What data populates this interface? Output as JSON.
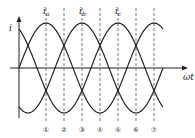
{
  "diagram": {
    "y_axis_label": "i",
    "x_axis_label": "ωt",
    "curves": [
      {
        "name": "ia",
        "label_main": "i",
        "label_sub": "a",
        "peak_x": 46
      },
      {
        "name": "ib",
        "label_main": "i",
        "label_sub": "b",
        "peak_x": 82
      },
      {
        "name": "ic",
        "label_main": "i",
        "label_sub": "c",
        "peak_x": 118
      }
    ],
    "markers": [
      "①",
      "②",
      "③",
      "④",
      "⑤",
      "⑥",
      "⑦"
    ],
    "colors": {
      "line": "#222222",
      "dash": "#555555"
    }
  }
}
